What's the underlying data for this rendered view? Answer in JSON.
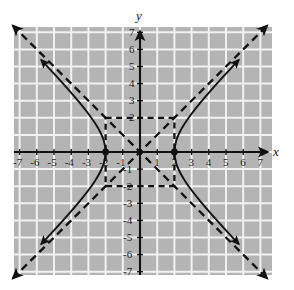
{
  "figure": {
    "background_color": "#ffffff",
    "grid_fill_color": "#b4b4b4",
    "grid_line_color": "#f2f2f2",
    "axis_color": "#111111",
    "curve_color": "#111111",
    "asymptote_color": "#111111",
    "x_axis_name": "x",
    "y_axis_name": "y"
  },
  "chart_data": {
    "type": "line",
    "title": "",
    "subtitle": "",
    "xlabel": "x",
    "ylabel": "y",
    "xlim": [
      -7.5,
      7.5
    ],
    "ylim": [
      -7.5,
      7.5
    ],
    "grid": true,
    "grid_spacing": 1,
    "legend": "none",
    "x_tick_labels": [
      "-7",
      "-6",
      "-5",
      "-4",
      "-3",
      "-2",
      "-1",
      "1",
      "2",
      "3",
      "4",
      "5",
      "6",
      "7"
    ],
    "x_tick_values": [
      -7,
      -6,
      -5,
      -4,
      -3,
      -2,
      -1,
      1,
      2,
      3,
      4,
      5,
      6,
      7
    ],
    "y_tick_labels": [
      "7",
      "6",
      "5",
      "4",
      "3",
      "2",
      "-1",
      "-2",
      "-3",
      "-4",
      "-5",
      "-6",
      "-7"
    ],
    "y_tick_values": [
      7,
      6,
      5,
      4,
      3,
      2,
      -1,
      -2,
      -3,
      -4,
      -5,
      -6,
      -7
    ],
    "series": [
      {
        "name": "hyperbola-right-branch",
        "style": "solid",
        "equation": "x^2/4 - y^2/4 = 1, x >= 2",
        "arrowheads": [
          "start",
          "end"
        ],
        "points": [
          [
            5.75,
            -5.39
          ],
          [
            5.0,
            -4.58
          ],
          [
            4.2,
            -3.69
          ],
          [
            3.5,
            -2.87
          ],
          [
            3.0,
            -2.24
          ],
          [
            2.6,
            -1.66
          ],
          [
            2.3,
            -1.14
          ],
          [
            2.1,
            -0.64
          ],
          [
            2.0,
            0.0
          ],
          [
            2.1,
            0.64
          ],
          [
            2.3,
            1.14
          ],
          [
            2.6,
            1.66
          ],
          [
            3.0,
            2.24
          ],
          [
            3.5,
            2.87
          ],
          [
            4.2,
            3.69
          ],
          [
            5.0,
            4.58
          ],
          [
            5.75,
            5.39
          ]
        ]
      },
      {
        "name": "hyperbola-left-branch",
        "style": "solid",
        "equation": "x^2/4 - y^2/4 = 1, x <= -2",
        "arrowheads": [
          "start",
          "end"
        ],
        "points": [
          [
            -5.75,
            -5.39
          ],
          [
            -5.0,
            -4.58
          ],
          [
            -4.2,
            -3.69
          ],
          [
            -3.5,
            -2.87
          ],
          [
            -3.0,
            -2.24
          ],
          [
            -2.6,
            -1.66
          ],
          [
            -2.3,
            -1.14
          ],
          [
            -2.1,
            -0.64
          ],
          [
            -2.0,
            0.0
          ],
          [
            -2.1,
            0.64
          ],
          [
            -2.3,
            1.14
          ],
          [
            -2.6,
            1.66
          ],
          [
            -3.0,
            2.24
          ],
          [
            -3.5,
            2.87
          ],
          [
            -4.2,
            3.69
          ],
          [
            -5.0,
            4.58
          ],
          [
            -5.75,
            5.39
          ]
        ]
      },
      {
        "name": "asymptote-positive-slope",
        "style": "dashed",
        "equation": "y = x",
        "arrowheads": [
          "start",
          "end"
        ],
        "points": [
          [
            -7.4,
            -7.4
          ],
          [
            7.4,
            7.4
          ]
        ]
      },
      {
        "name": "asymptote-negative-slope",
        "style": "dashed",
        "equation": "y = -x",
        "arrowheads": [
          "start",
          "end"
        ],
        "points": [
          [
            -7.4,
            7.4
          ],
          [
            7.4,
            -7.4
          ]
        ]
      },
      {
        "name": "fundamental-rectangle",
        "style": "dashed",
        "equation": "|x| = 2, |y| = 2",
        "arrowheads": [],
        "points": [
          [
            -2,
            2
          ],
          [
            2,
            2
          ],
          [
            2,
            -2
          ],
          [
            -2,
            -2
          ],
          [
            -2,
            2
          ]
        ]
      }
    ],
    "markers": [
      {
        "name": "vertex-left",
        "x": -2,
        "y": 0,
        "label": ""
      },
      {
        "name": "vertex-right",
        "x": 2,
        "y": 0,
        "label": ""
      }
    ],
    "annotations": []
  }
}
